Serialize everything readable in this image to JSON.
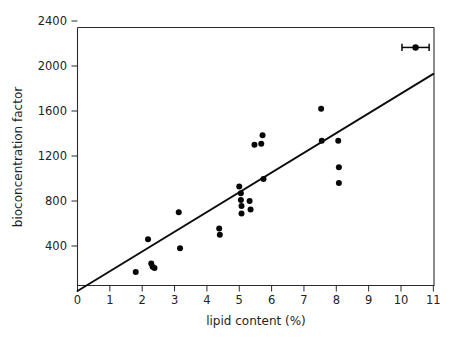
{
  "chart_data": {
    "type": "scatter",
    "title": "",
    "xlabel": "lipid content (%)",
    "ylabel": "bioconcentration factor",
    "xlim": [
      0,
      11
    ],
    "ylim": [
      0,
      2600
    ],
    "grid": false,
    "legend": null,
    "xticks": [
      0,
      1,
      2,
      3,
      4,
      5,
      6,
      7,
      8,
      9,
      10,
      11
    ],
    "xtick_labels": [
      "0",
      "1",
      "2",
      "3",
      "4",
      "5",
      "6",
      "7",
      "8",
      "9",
      "10",
      "11"
    ],
    "yticks": [
      400,
      800,
      1200,
      1600,
      2000,
      2400
    ],
    "ytick_labels": [
      "400",
      "800",
      "1200",
      "1600",
      "2000",
      "2400"
    ],
    "points": [
      {
        "x": 1.8,
        "y": 170
      },
      {
        "x": 2.18,
        "y": 460
      },
      {
        "x": 2.28,
        "y": 245
      },
      {
        "x": 2.32,
        "y": 215
      },
      {
        "x": 2.38,
        "y": 205
      },
      {
        "x": 3.13,
        "y": 700
      },
      {
        "x": 3.17,
        "y": 380
      },
      {
        "x": 4.38,
        "y": 555
      },
      {
        "x": 4.4,
        "y": 500
      },
      {
        "x": 5.0,
        "y": 930
      },
      {
        "x": 5.05,
        "y": 870
      },
      {
        "x": 5.05,
        "y": 810
      },
      {
        "x": 5.07,
        "y": 755
      },
      {
        "x": 5.07,
        "y": 690
      },
      {
        "x": 5.32,
        "y": 800
      },
      {
        "x": 5.35,
        "y": 725
      },
      {
        "x": 5.47,
        "y": 1300
      },
      {
        "x": 5.68,
        "y": 1310
      },
      {
        "x": 5.72,
        "y": 1385
      },
      {
        "x": 5.75,
        "y": 995
      },
      {
        "x": 7.53,
        "y": 1620
      },
      {
        "x": 7.55,
        "y": 1335
      },
      {
        "x": 8.06,
        "y": 1335
      },
      {
        "x": 8.08,
        "y": 1100
      },
      {
        "x": 8.08,
        "y": 960
      }
    ],
    "trend_line": {
      "x0": 0,
      "y0": 0,
      "x1": 11,
      "y1": 1930,
      "slope": 175.5,
      "intercept": 0
    },
    "error_bar_marker": {
      "x": 10.45,
      "y": 2165,
      "x_error": 0.42,
      "description": "mean point with horizontal error bar"
    }
  },
  "axis_titles": {
    "x": "lipid content (%)",
    "y": "bioconcentration factor"
  }
}
